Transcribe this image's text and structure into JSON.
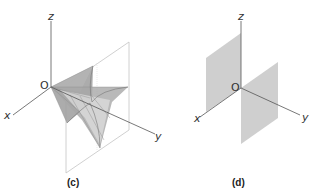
{
  "panels": [
    {
      "id": "c",
      "caption": "(c)",
      "axes": {
        "x": "x",
        "y": "y",
        "z": "z",
        "origin": "O"
      },
      "description": "Ruled saddle-like surface bounded by a vertical rectangular frame through the origin"
    },
    {
      "id": "d",
      "caption": "(d)",
      "axes": {
        "x": "x",
        "y": "y",
        "z": "z",
        "origin": "O"
      },
      "description": "Two shaded half-planes: one above origin along negative y, one below origin along positive y"
    }
  ],
  "colors": {
    "axis": "#555555",
    "frame": "#bbbbbb",
    "surface": "#9a9a9a",
    "plane": "#cfcfcf"
  }
}
